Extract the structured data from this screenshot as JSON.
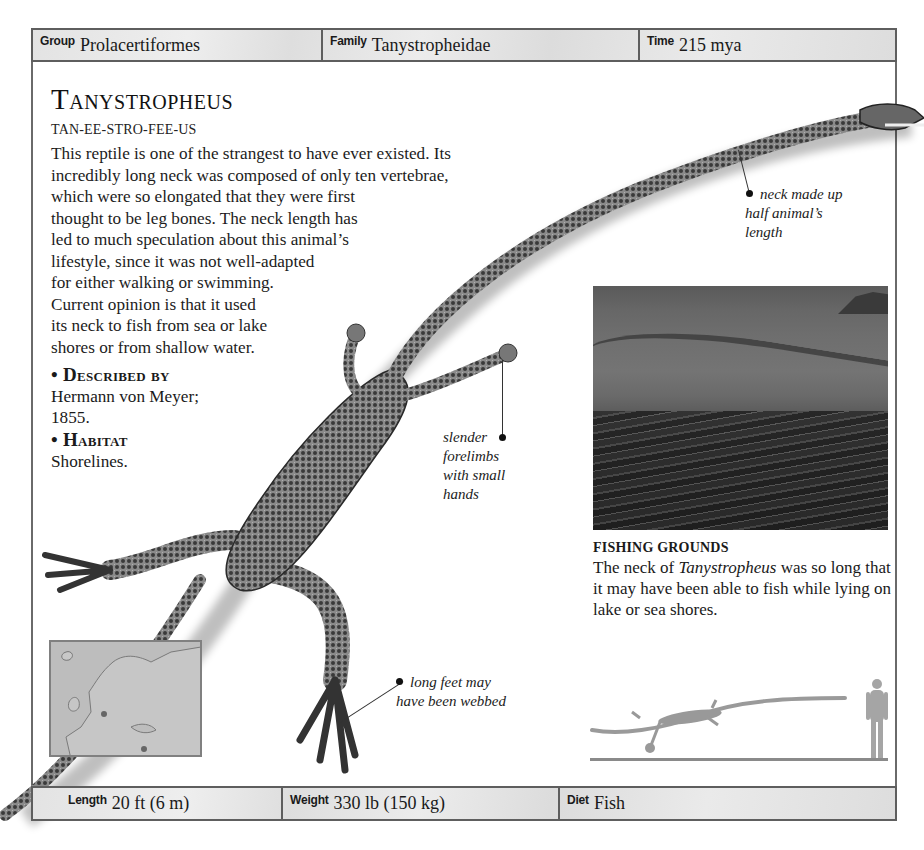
{
  "header": {
    "group": {
      "label": "Group",
      "value": "Prolacertiformes"
    },
    "family": {
      "label": "Family",
      "value": "Tanystropheidae"
    },
    "time": {
      "label": "Time",
      "value": "215 mya"
    }
  },
  "title": "Tanystropheus",
  "pronunciation": "TAN-EE-STRO-FEE-US",
  "description_lines": [
    "This reptile is one of the strangest to have ever existed. Its",
    "incredibly long neck was composed of only ten vertebrae,",
    "which were so elongated that they were first",
    "thought to be leg bones. The neck length has",
    "led to much speculation about this animal’s",
    "lifestyle, since it was not well-adapted",
    "for either walking or swimming.",
    "Current opinion is that it used",
    "its neck to fish from sea or lake",
    "shores or from shallow water."
  ],
  "facts": {
    "described_by": {
      "heading": "• Described by",
      "lines": [
        "Hermann von Meyer;",
        "1855."
      ]
    },
    "habitat": {
      "heading": "• Habitat",
      "lines": [
        "Shorelines."
      ]
    }
  },
  "callouts": {
    "neck": [
      "neck made up",
      "half animal’s",
      "length"
    ],
    "forelimbs": [
      "slender",
      "forelimbs",
      "with small",
      "hands"
    ],
    "feet": [
      "long feet may",
      "have been webbed"
    ]
  },
  "photo_caption": {
    "title": "FISHING GROUNDS",
    "text_before": "The neck of ",
    "text_italic": "Tanystropheus",
    "text_after": " was so long that it may have been able to fish while lying on lake or sea shores."
  },
  "footer": {
    "length": {
      "label": "Length",
      "value": "20 ft (6 m)"
    },
    "weight": {
      "label": "Weight",
      "value": "330 lb (150 kg)"
    },
    "diet": {
      "label": "Diet",
      "value": "Fish"
    }
  },
  "colors": {
    "bar_bg": "#e3e3e3",
    "border": "#5e5e5e",
    "text": "#1a1a1a",
    "map_bg": "#bdbdbd"
  }
}
